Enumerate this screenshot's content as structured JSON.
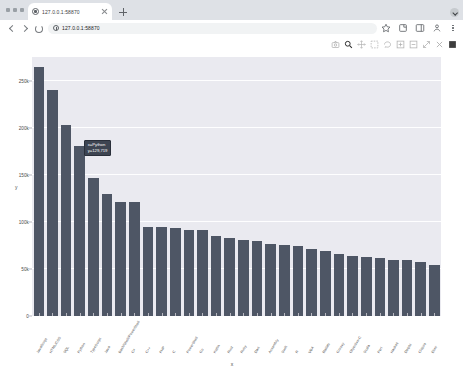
{
  "browser": {
    "window_buttons": [
      "minimize",
      "maximize",
      "close"
    ],
    "tab": {
      "title": "127.0.0.1:58870",
      "favicon": "globe-icon",
      "close_label": "×"
    },
    "new_tab_label": "+",
    "tabstrip_dropdown": "chevron-down-icon",
    "nav": {
      "back": "back-arrow-icon",
      "forward": "forward-arrow-icon",
      "reload": "reload-icon"
    },
    "omnibox": {
      "value": "127.0.0.1:58870",
      "placeholder": "Search Google or type a URL",
      "info_icon": "info-circle-icon"
    },
    "toolbar_icons": [
      "bookmark-star-icon",
      "extensions-icon",
      "side-panel-icon",
      "profile-icon",
      "more-menu-icon"
    ]
  },
  "plotly": {
    "modebar_buttons": [
      "camera-download-icon",
      "zoom-magnifier-icon",
      "pan-move-icon",
      "box-select-icon",
      "lasso-select-icon",
      "zoom-in-icon",
      "zoom-out-icon",
      "autoscale-icon",
      "reset-axes-icon",
      "toggle-spikelines-icon"
    ]
  },
  "chart_data": {
    "type": "bar",
    "title": "",
    "xlabel": "x",
    "ylabel": "y",
    "ylim": [
      0,
      275000
    ],
    "yticks": [
      0,
      50000,
      100000,
      150000,
      200000,
      250000
    ],
    "ytick_labels": [
      "0",
      "50k",
      "100k",
      "150k",
      "200k",
      "250k"
    ],
    "grid": true,
    "legend": "none",
    "bar_color": "#4e5665",
    "plot_bgcolor": "#eaeaf0",
    "paper_bgcolor": "#ffffff",
    "categories": [
      "JavaScript",
      "HTML/CSS",
      "SQL",
      "Python",
      "TypeScript",
      "Java",
      "Bash/Shell/PowerShell",
      "C#",
      "C++",
      "PHP",
      "C",
      "PowerShell",
      "Go",
      "Kotlin",
      "Rust",
      "Ruby",
      "Dart",
      "Assembly",
      "Swift",
      "R",
      "VBA",
      "Matlab",
      "Groovy",
      "Objective-C",
      "Scala",
      "Perl",
      "Haskell",
      "Delphi",
      "Clojure",
      "Elixir"
    ],
    "values": [
      264000,
      240000,
      203000,
      181000,
      147000,
      130000,
      121000,
      121000,
      95000,
      95000,
      93000,
      91000,
      91000,
      85000,
      83000,
      81000,
      80000,
      76000,
      75000,
      74000,
      71000,
      69000,
      66000,
      64000,
      63000,
      62000,
      60000,
      59000,
      57000,
      54000
    ]
  },
  "tooltip": {
    "visible": true,
    "line1": "x=Python",
    "line2": "y=129,719"
  }
}
